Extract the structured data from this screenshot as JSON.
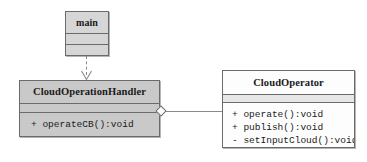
{
  "diagram": {
    "type": "uml-class-diagram",
    "background_color": "#ffffff",
    "line_color": "#8a8a8a",
    "border_color": "#6b6b6b",
    "text_color": "#1a1a1a"
  },
  "classes": [
    {
      "id": "main",
      "name": "main",
      "fill_color": "#d6d6d6",
      "attributes": [],
      "methods": []
    },
    {
      "id": "cloud_operation_handler",
      "name": "CloudOperationHandler",
      "fill_color": "#c9c9c9",
      "attributes": [],
      "methods": [
        {
          "visibility": "+",
          "signature": "operateCB():void",
          "text": "+ operateCB():void"
        }
      ]
    },
    {
      "id": "cloud_operator",
      "name": "CloudOperator",
      "fill_color": "#fdfdfd",
      "attributes": [],
      "methods": [
        {
          "visibility": "+",
          "signature": "operate():void",
          "text": "+ operate():void"
        },
        {
          "visibility": "+",
          "signature": "publish():void",
          "text": "+ publish():void"
        },
        {
          "visibility": "-",
          "signature": "setInputCloud():void",
          "text": "- setInputCloud():void"
        }
      ]
    }
  ],
  "relationships": [
    {
      "id": "dependency-main-to-handler",
      "kind": "dependency",
      "style": "dashed",
      "arrow": "open-arrowhead",
      "from": "main",
      "to": "cloud_operation_handler"
    },
    {
      "id": "aggregation-handler-to-operator",
      "kind": "aggregation",
      "style": "solid",
      "arrow": "hollow-diamond",
      "from": "cloud_operation_handler",
      "to": "cloud_operator"
    }
  ]
}
